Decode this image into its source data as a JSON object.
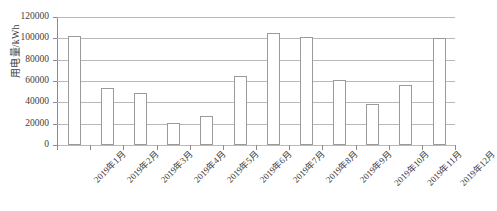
{
  "chart_data": {
    "type": "bar",
    "title": "",
    "subtitle": "",
    "xlabel": "",
    "ylabel": "用电量/kWh",
    "ylim": [
      0,
      120000
    ],
    "ytick_step": 20000,
    "ytick_labels": [
      "120000",
      "100000",
      "80000",
      "60000",
      "40000",
      "20000",
      "0"
    ],
    "ytick_values": [
      120000,
      100000,
      80000,
      60000,
      40000,
      20000,
      0
    ],
    "grid": true,
    "grid_axis": "y",
    "legend": false,
    "legend_position": "none",
    "bar_fill_color": "#ffffff",
    "bar_edge_color": "#9a9a9a",
    "grid_color": "#b9b9b9",
    "axis_color": "#8c8c8c",
    "categories": [
      "2019年1月",
      "2019年2月",
      "2019年3月",
      "2019年4月",
      "2019年5月",
      "2019年6月",
      "2019年7月",
      "2019年8月",
      "2019年9月",
      "2019年10月",
      "2019年11月",
      "2019年12月"
    ],
    "values": [
      102000,
      53000,
      49000,
      21000,
      27000,
      65000,
      105000,
      101000,
      61000,
      38000,
      56000,
      100000
    ]
  }
}
